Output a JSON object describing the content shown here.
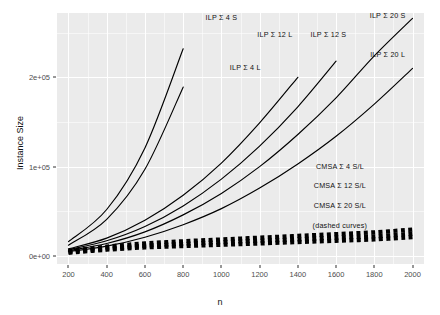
{
  "chart_data": {
    "type": "line",
    "title": "",
    "xlabel": "n",
    "ylabel": "Instance Size",
    "xlim": [
      140,
      2060
    ],
    "ylim": [
      -9000,
      272000
    ],
    "grid": true,
    "legend_position": "inline-annotations",
    "xticks": [
      200,
      400,
      600,
      800,
      1000,
      1200,
      1400,
      1600,
      1800,
      2000
    ],
    "xtick_labels": [
      "200",
      "400",
      "600",
      "800",
      "1000",
      "1200",
      "1400",
      "1600",
      "1800",
      "2000"
    ],
    "yticks": [
      0,
      100000,
      200000
    ],
    "ytick_labels": [
      "0e+00",
      "1e+05",
      "2e+05"
    ],
    "x": [
      200,
      400,
      600,
      800,
      1000,
      1200,
      1400,
      1600,
      1800,
      2000
    ],
    "series": [
      {
        "name": "ILP Σ 4 S",
        "style": "solid",
        "color": "#000000",
        "label_x": 1000,
        "label_y": 268000,
        "values": [
          16000,
          52000,
          121000,
          232000,
          null,
          null,
          null,
          null,
          null,
          null
        ]
      },
      {
        "name": "ILP Σ 4 L",
        "style": "solid",
        "color": "#000000",
        "label_x": 1125,
        "label_y": 212000,
        "values": [
          12000,
          41000,
          97000,
          189000,
          null,
          null,
          null,
          null,
          null,
          null
        ]
      },
      {
        "name": "ILP Σ 12 L",
        "style": "solid",
        "color": "#000000",
        "label_x": 1280,
        "label_y": 248000,
        "values": [
          8000,
          20000,
          40000,
          68000,
          104000,
          149000,
          200000,
          null,
          null,
          null
        ]
      },
      {
        "name": "ILP Σ 12 S",
        "style": "solid",
        "color": "#000000",
        "label_x": 1560,
        "label_y": 248000,
        "values": [
          7000,
          17000,
          33000,
          56000,
          86000,
          123000,
          167000,
          218000,
          null,
          null
        ]
      },
      {
        "name": "ILP Σ 20 S",
        "style": "solid",
        "color": "#000000",
        "label_x": 1870,
        "label_y": 270000,
        "values": [
          6000,
          14000,
          27000,
          46000,
          70000,
          100000,
          136000,
          177000,
          224000,
          266000
        ]
      },
      {
        "name": "ILP Σ 20 L",
        "style": "solid",
        "color": "#000000",
        "label_x": 1870,
        "label_y": 226000,
        "values": [
          5000,
          11000,
          21000,
          35000,
          53000,
          76000,
          103000,
          134000,
          170000,
          210000
        ]
      },
      {
        "name": "CMSA Σ 4 S/L",
        "style": "dashed",
        "color": "#000000",
        "label_x": 1620,
        "label_y": 101000,
        "values": [
          5500,
          10500,
          14000,
          16500,
          18500,
          20500,
          22500,
          24500,
          26500,
          29500
        ]
      },
      {
        "name": "CMSA Σ 12 S/L",
        "style": "dashed",
        "color": "#000000",
        "label_x": 1620,
        "label_y": 79000,
        "values": [
          4500,
          8500,
          11500,
          13500,
          15500,
          17000,
          18500,
          20500,
          22000,
          25000
        ]
      },
      {
        "name": "CMSA Σ 20 S/L",
        "style": "dashed",
        "color": "#000000",
        "label_x": 1620,
        "label_y": 57000,
        "values": [
          3500,
          7000,
          9500,
          11000,
          12500,
          14000,
          15500,
          17000,
          18500,
          21000
        ]
      }
    ],
    "annotations": [
      {
        "text": "(dashed curves)",
        "x": 1620,
        "y": 35000
      }
    ]
  },
  "axes": {
    "x_title": "n",
    "y_title": "Instance Size"
  },
  "style": {
    "panel_bg": "#ebebeb",
    "grid_color": "#ffffff",
    "line_color": "#000000",
    "text_color": "#111111",
    "tick_text_color": "#4d4d4d"
  }
}
